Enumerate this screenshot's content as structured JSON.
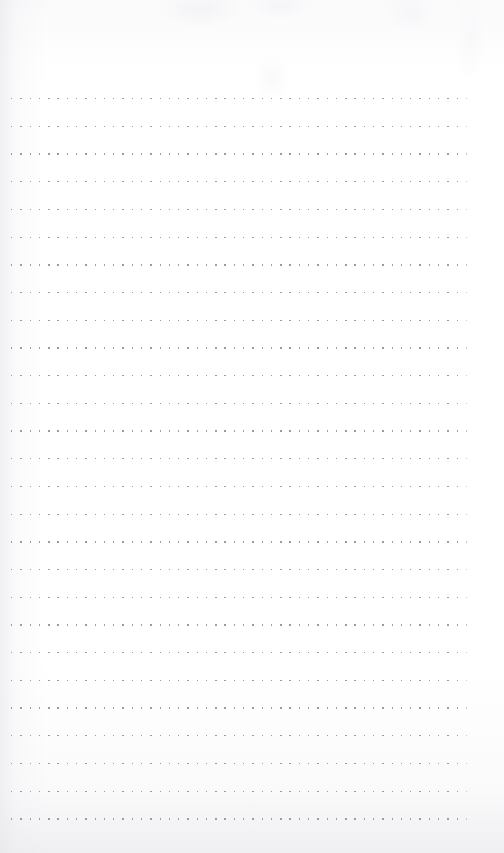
{
  "document": {
    "type": "dot-grid-notebook-page",
    "title": "Blank dotted notebook page",
    "page_width": 504,
    "page_height": 853,
    "content_text": "",
    "has_handwriting": false,
    "has_printed_text": false
  },
  "paper": {
    "background_color": "#fefefe",
    "tint_color": "#fbfbfc",
    "scan_shadow_color": "#e4e4e8"
  },
  "ruling": {
    "style": "dotted-lines",
    "dot_color": "#9b9ba8",
    "dot_size_px": 1.4,
    "dot_spacing_px": 9.3,
    "row_count": 27,
    "first_row_y": 98,
    "row_spacing_px": 27.7,
    "left_margin_px": 11,
    "right_edge_px": 471,
    "dots_per_row": 50,
    "top_margin_px": 98,
    "bottom_margin_px": 34
  }
}
